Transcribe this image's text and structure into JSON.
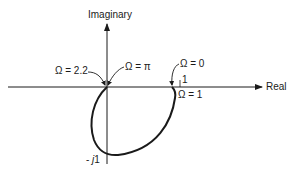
{
  "diagram": {
    "type": "nyquist-plot",
    "axes": {
      "x_label": "Real",
      "y_label": "Imaginary",
      "x_tick": "1",
      "y_tick_prefix": "- ",
      "y_tick_j": "j",
      "y_tick_value": "1"
    },
    "annotations": {
      "omega_2_2": "Ω = 2.2",
      "omega_pi": "Ω = π",
      "omega_0": "Ω = 0",
      "omega_1": "Ω = 1"
    },
    "colors": {
      "ink": "#1a1a1a",
      "background": "#ffffff"
    }
  }
}
